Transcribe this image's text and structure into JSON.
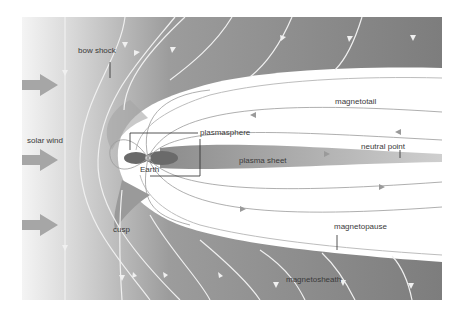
{
  "diagram": {
    "colors": {
      "background_light": "#f2f2f2",
      "sheath_dark": "#8a8a8a",
      "magnetosphere_white": "#ffffff",
      "plasma_sheet": "#b0b0b0",
      "plasmasphere_dark": "#6e6e6e",
      "field_line": "#f5f5f5",
      "inner_field_line": "#9a9a9a",
      "solar_wind_arrow": "#a6a6a6"
    },
    "labels": {
      "bow_shock": "bow shock",
      "solar_wind": "solar wind",
      "plasmasphere": "plasmasphere",
      "earth": "Earth",
      "plasma_sheet": "plasma sheet",
      "magnetotail": "magnetotail",
      "neutral_point": "neutral point",
      "cusp": "cusp",
      "magnetopause": "magnetopause",
      "magnetosheath": "magnetosheath"
    },
    "solar_wind_arrows": 3
  }
}
